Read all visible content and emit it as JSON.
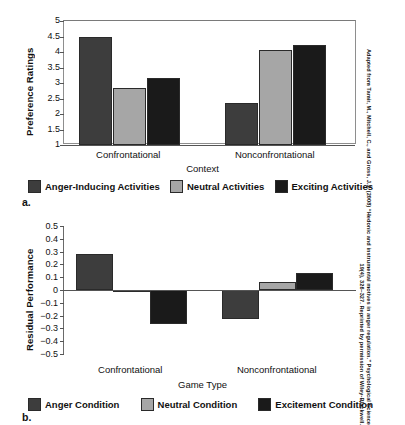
{
  "source_citation": {
    "line1": "Adapted from Tamir, M., Mitchell, C., and Gross, J.J. (2008) “Hedonic and instrumental motives in anger regulation.” Psychological Science",
    "line2": "19(4), 326–327. Reprinted by permission of Wiley-Blackwell."
  },
  "panel_a": {
    "letter": "a.",
    "chart_data": {
      "type": "bar",
      "title": "",
      "xlabel": "Context",
      "ylabel": "Preference Ratings",
      "categories": [
        "Confrontational",
        "Nonconfrontational"
      ],
      "ylim": [
        1,
        5
      ],
      "ybase": 1,
      "yticks": [
        1,
        1.5,
        2,
        2.5,
        3,
        3.5,
        4,
        4.5,
        5
      ],
      "ytick_labels": [
        "1",
        "1.5",
        "2",
        "2.5",
        "3",
        "3.5",
        "4",
        "4.5",
        "5"
      ],
      "grid": false,
      "legend_position": "bottom",
      "series": [
        {
          "name": "Anger-Inducing Activities",
          "color": "#3d3d3d",
          "values": [
            4.47,
            2.37
          ]
        },
        {
          "name": "Neutral Activities",
          "color": "#a6a6a6",
          "values": [
            2.83,
            4.07
          ]
        },
        {
          "name": "Exciting Activities",
          "color": "#1a1a1a",
          "values": [
            3.17,
            4.22
          ]
        }
      ]
    }
  },
  "panel_b": {
    "letter": "b.",
    "chart_data": {
      "type": "bar",
      "title": "",
      "xlabel": "Game Type",
      "ylabel": "Residual Performance",
      "categories": [
        "Confrontational",
        "Nonconfrontational"
      ],
      "ylim": [
        -0.5,
        0.5
      ],
      "ybase": 0,
      "yticks": [
        0.5,
        0.4,
        0.3,
        0.2,
        0.1,
        0,
        -0.1,
        -0.2,
        -0.3,
        -0.4,
        -0.5
      ],
      "ytick_labels": [
        "0.5",
        "0.4",
        "0.3",
        "0.2",
        "0.1",
        "0",
        "−0.1",
        "−0.2",
        "−0.3",
        "−0.4",
        "−0.5"
      ],
      "grid": false,
      "legend_position": "bottom",
      "series": [
        {
          "name": "Anger Condition",
          "color": "#3d3d3d",
          "values": [
            0.285,
            -0.23
          ]
        },
        {
          "name": "Neutral Condition",
          "color": "#a6a6a6",
          "values": [
            -0.012,
            0.06
          ]
        },
        {
          "name": "Excitement Condition",
          "color": "#1a1a1a",
          "values": [
            -0.265,
            0.135
          ]
        }
      ]
    }
  }
}
